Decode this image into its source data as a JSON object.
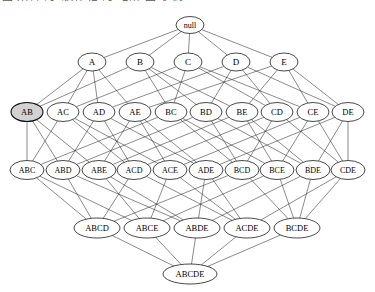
{
  "caption": {
    "text": "图 集合 的 幂集 格 的 哈斯 图 示例"
  },
  "diagram": {
    "universe": [
      "A",
      "B",
      "C",
      "D",
      "E"
    ],
    "node_fill": "#ffffff",
    "node_stroke": "#1a1a1a",
    "highlight_fill": "#d2d2d2",
    "edge_color": "#2b2b2b",
    "background": "#ffffff",
    "levels": [
      {
        "level": 0,
        "y": 25,
        "rx": 14,
        "ry": 8.5,
        "font_size": 8,
        "nodes": [
          {
            "id": "null",
            "label": "null",
            "x": 190,
            "highlighted": false
          }
        ]
      },
      {
        "level": 1,
        "y": 62,
        "rx": 14,
        "ry": 9,
        "font_size": 9,
        "nodes": [
          {
            "id": "A",
            "label": "A",
            "x": 92,
            "highlighted": false
          },
          {
            "id": "B",
            "label": "B",
            "x": 140,
            "highlighted": false
          },
          {
            "id": "C",
            "label": "C",
            "x": 188,
            "highlighted": false
          },
          {
            "id": "D",
            "label": "D",
            "x": 236,
            "highlighted": false
          },
          {
            "id": "E",
            "label": "E",
            "x": 284,
            "highlighted": false
          }
        ]
      },
      {
        "level": 2,
        "y": 112,
        "rx": 16,
        "ry": 9.5,
        "font_size": 8.5,
        "nodes": [
          {
            "id": "AB",
            "label": "AB",
            "x": 27,
            "highlighted": true
          },
          {
            "id": "AC",
            "label": "AC",
            "x": 63,
            "highlighted": false
          },
          {
            "id": "AD",
            "label": "AD",
            "x": 99,
            "highlighted": false
          },
          {
            "id": "AE",
            "label": "AE",
            "x": 135,
            "highlighted": false
          },
          {
            "id": "BC",
            "label": "BC",
            "x": 171,
            "highlighted": false
          },
          {
            "id": "BD",
            "label": "BD",
            "x": 206,
            "highlighted": false
          },
          {
            "id": "BE",
            "label": "BE",
            "x": 242,
            "highlighted": false
          },
          {
            "id": "CD",
            "label": "CD",
            "x": 277,
            "highlighted": false
          },
          {
            "id": "CE",
            "label": "CE",
            "x": 313,
            "highlighted": false
          },
          {
            "id": "DE",
            "label": "DE",
            "x": 348,
            "highlighted": false
          }
        ]
      },
      {
        "level": 3,
        "y": 170,
        "rx": 17,
        "ry": 9.5,
        "font_size": 8,
        "nodes": [
          {
            "id": "ABC",
            "label": "ABC",
            "x": 27,
            "highlighted": false
          },
          {
            "id": "ABD",
            "label": "ABD",
            "x": 63,
            "highlighted": false
          },
          {
            "id": "ABE",
            "label": "ABE",
            "x": 99,
            "highlighted": false
          },
          {
            "id": "ACD",
            "label": "ACD",
            "x": 134,
            "highlighted": false
          },
          {
            "id": "ACE",
            "label": "ACE",
            "x": 170,
            "highlighted": false
          },
          {
            "id": "ADE",
            "label": "ADE",
            "x": 206,
            "highlighted": false
          },
          {
            "id": "BCD",
            "label": "BCD",
            "x": 242,
            "highlighted": false
          },
          {
            "id": "BCE",
            "label": "BCE",
            "x": 277,
            "highlighted": false
          },
          {
            "id": "BDE",
            "label": "BDE",
            "x": 313,
            "highlighted": false
          },
          {
            "id": "CDE",
            "label": "CDE",
            "x": 348,
            "highlighted": false
          }
        ]
      },
      {
        "level": 4,
        "y": 228,
        "rx": 23,
        "ry": 10,
        "font_size": 8.5,
        "nodes": [
          {
            "id": "ABCD",
            "label": "ABCD",
            "x": 97,
            "highlighted": false
          },
          {
            "id": "ABCE",
            "label": "ABCE",
            "x": 147,
            "highlighted": false
          },
          {
            "id": "ABDE",
            "label": "ABDE",
            "x": 197,
            "highlighted": false
          },
          {
            "id": "ACDE",
            "label": "ACDE",
            "x": 247,
            "highlighted": false
          },
          {
            "id": "BCDE",
            "label": "BCDE",
            "x": 297,
            "highlighted": false
          }
        ]
      },
      {
        "level": 5,
        "y": 274,
        "rx": 27,
        "ry": 10,
        "font_size": 8.5,
        "nodes": [
          {
            "id": "ABCDE",
            "label": "ABCDE",
            "x": 190,
            "highlighted": false
          }
        ]
      }
    ],
    "edges": [
      [
        "null",
        "A"
      ],
      [
        "null",
        "B"
      ],
      [
        "null",
        "C"
      ],
      [
        "null",
        "D"
      ],
      [
        "null",
        "E"
      ],
      [
        "A",
        "AB"
      ],
      [
        "A",
        "AC"
      ],
      [
        "A",
        "AD"
      ],
      [
        "A",
        "AE"
      ],
      [
        "B",
        "AB"
      ],
      [
        "B",
        "BC"
      ],
      [
        "B",
        "BD"
      ],
      [
        "B",
        "BE"
      ],
      [
        "C",
        "AC"
      ],
      [
        "C",
        "BC"
      ],
      [
        "C",
        "CD"
      ],
      [
        "C",
        "CE"
      ],
      [
        "D",
        "AD"
      ],
      [
        "D",
        "BD"
      ],
      [
        "D",
        "CD"
      ],
      [
        "D",
        "DE"
      ],
      [
        "E",
        "AE"
      ],
      [
        "E",
        "BE"
      ],
      [
        "E",
        "CE"
      ],
      [
        "E",
        "DE"
      ],
      [
        "AB",
        "ABC"
      ],
      [
        "AB",
        "ABD"
      ],
      [
        "AB",
        "ABE"
      ],
      [
        "AC",
        "ABC"
      ],
      [
        "AC",
        "ACD"
      ],
      [
        "AC",
        "ACE"
      ],
      [
        "AD",
        "ABD"
      ],
      [
        "AD",
        "ACD"
      ],
      [
        "AD",
        "ADE"
      ],
      [
        "AE",
        "ABE"
      ],
      [
        "AE",
        "ACE"
      ],
      [
        "AE",
        "ADE"
      ],
      [
        "BC",
        "ABC"
      ],
      [
        "BC",
        "BCD"
      ],
      [
        "BC",
        "BCE"
      ],
      [
        "BD",
        "ABD"
      ],
      [
        "BD",
        "BCD"
      ],
      [
        "BD",
        "BDE"
      ],
      [
        "BE",
        "ABE"
      ],
      [
        "BE",
        "BCE"
      ],
      [
        "BE",
        "BDE"
      ],
      [
        "CD",
        "ACD"
      ],
      [
        "CD",
        "BCD"
      ],
      [
        "CD",
        "CDE"
      ],
      [
        "CE",
        "ACE"
      ],
      [
        "CE",
        "BCE"
      ],
      [
        "CE",
        "CDE"
      ],
      [
        "DE",
        "ADE"
      ],
      [
        "DE",
        "BDE"
      ],
      [
        "DE",
        "CDE"
      ],
      [
        "ABC",
        "ABCD"
      ],
      [
        "ABC",
        "ABCE"
      ],
      [
        "ABD",
        "ABCD"
      ],
      [
        "ABD",
        "ABDE"
      ],
      [
        "ABE",
        "ABCE"
      ],
      [
        "ABE",
        "ABDE"
      ],
      [
        "ACD",
        "ABCD"
      ],
      [
        "ACD",
        "ACDE"
      ],
      [
        "ACE",
        "ABCE"
      ],
      [
        "ACE",
        "ACDE"
      ],
      [
        "ADE",
        "ABDE"
      ],
      [
        "ADE",
        "ACDE"
      ],
      [
        "BCD",
        "ABCD"
      ],
      [
        "BCD",
        "BCDE"
      ],
      [
        "BCE",
        "ABCE"
      ],
      [
        "BCE",
        "BCDE"
      ],
      [
        "BDE",
        "ABDE"
      ],
      [
        "BDE",
        "BCDE"
      ],
      [
        "CDE",
        "ACDE"
      ],
      [
        "CDE",
        "BCDE"
      ],
      [
        "ABCD",
        "ABCDE"
      ],
      [
        "ABCE",
        "ABCDE"
      ],
      [
        "ABDE",
        "ABCDE"
      ],
      [
        "ACDE",
        "ABCDE"
      ],
      [
        "BCDE",
        "ABCDE"
      ]
    ]
  }
}
